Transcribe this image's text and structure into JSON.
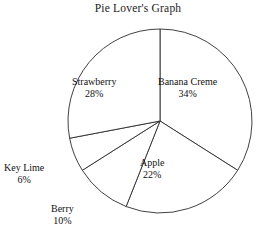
{
  "chart_data": {
    "type": "pie",
    "title": "Pie Lover's Graph",
    "xlabel": "",
    "ylabel": "",
    "legend": "none",
    "grid": false,
    "units": "percent",
    "total": 100,
    "start_angle_deg": 0,
    "direction": "clockwise",
    "categories": [
      "Banana Creme",
      "Apple",
      "Berry",
      "Key Lime",
      "Strawberry"
    ],
    "values": [
      34,
      22,
      10,
      6,
      28
    ],
    "slices": [
      {
        "name": "Banana Creme",
        "value": 34,
        "pct_label": "34%",
        "start_deg": 0,
        "end_deg": 122.4,
        "label_placement": "inside",
        "label_left": 158,
        "label_top": 76
      },
      {
        "name": "Apple",
        "value": 22,
        "pct_label": "22%",
        "start_deg": 122.4,
        "end_deg": 201.6,
        "label_placement": "inside",
        "label_left": 140,
        "label_top": 157
      },
      {
        "name": "Berry",
        "value": 10,
        "pct_label": "10%",
        "start_deg": 201.6,
        "end_deg": 237.6,
        "label_placement": "outside",
        "label_left": 51,
        "label_top": 203
      },
      {
        "name": "Key Lime",
        "value": 6,
        "pct_label": "6%",
        "start_deg": 237.6,
        "end_deg": 259.2,
        "label_placement": "outside",
        "label_left": 4,
        "label_top": 162
      },
      {
        "name": "Strawberry",
        "value": 28,
        "pct_label": "28%",
        "start_deg": 259.2,
        "end_deg": 360,
        "label_placement": "inside",
        "label_left": 72,
        "label_top": 76
      }
    ],
    "geometry": {
      "center_x": 160,
      "center_y": 121,
      "radius": 92
    },
    "colors": {
      "background": "#ffffff",
      "slice_fill": "#ffffff",
      "outline": "#2b2b2b",
      "text": "#111111"
    }
  }
}
